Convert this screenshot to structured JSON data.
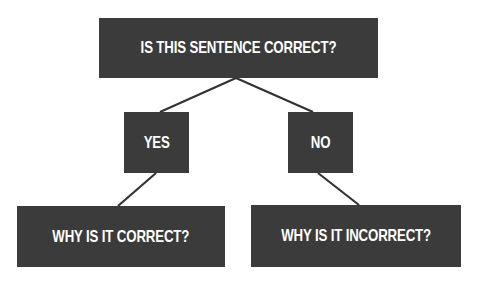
{
  "diagram": {
    "type": "decision-tree",
    "colors": {
      "background": "#ffffff",
      "node_fill": "#3b3b3b",
      "node_text": "#ffffff",
      "connector": "#333333"
    },
    "nodes": {
      "root": {
        "label": "IS THIS SENTENCE CORRECT?"
      },
      "yes": {
        "label": "YES"
      },
      "no": {
        "label": "NO"
      },
      "why_correct": {
        "label": "WHY IS IT CORRECT?"
      },
      "why_incorrect": {
        "label": "WHY IS IT INCORRECT?"
      }
    },
    "edges": [
      {
        "from": "root",
        "to": "yes"
      },
      {
        "from": "root",
        "to": "no"
      },
      {
        "from": "yes",
        "to": "why_correct"
      },
      {
        "from": "no",
        "to": "why_incorrect"
      }
    ]
  }
}
